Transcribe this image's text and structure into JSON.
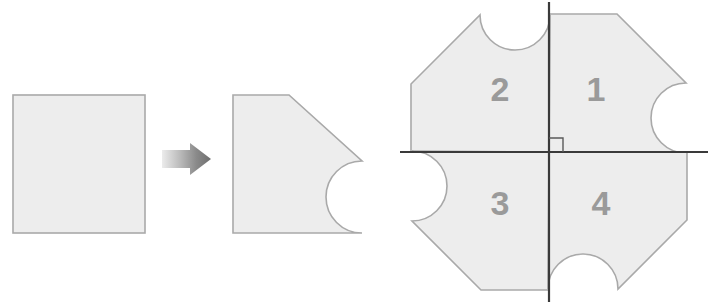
{
  "figure": {
    "background_color": "#ffffff",
    "shape_fill": "#ededed",
    "shape_stroke": "#a9a9a9",
    "axis_color": "#3a3a3a",
    "label_color": "#9a9a9a",
    "arrow_color_start": "#e8e8e8",
    "arrow_color_end": "#6e6e6e"
  },
  "panels": {
    "source_square": {
      "name": "square",
      "x": 13,
      "y": 95,
      "width": 132,
      "height": 138
    },
    "transform_arrow": {
      "name": "right-arrow",
      "x": 162,
      "y": 143,
      "width": 48,
      "height": 32,
      "direction": "right"
    },
    "result_shape": {
      "name": "notched-quarter-shape",
      "description": "square with top-right corner cut diagonally and a semicircular notch on the right edge"
    },
    "quadrant_figure": {
      "name": "four-quadrant-rotational-shape",
      "center_x": 549,
      "center_y": 152,
      "right_angle_marker": true,
      "quadrants": [
        {
          "label": "1",
          "position": "top-right",
          "label_x": 596,
          "label_y": 92
        },
        {
          "label": "2",
          "position": "top-left",
          "label_x": 500,
          "label_y": 92
        },
        {
          "label": "3",
          "position": "bottom-left",
          "label_x": 500,
          "label_y": 206
        },
        {
          "label": "4",
          "position": "bottom-right",
          "label_x": 601,
          "label_y": 206
        }
      ],
      "axes": {
        "horizontal": {
          "x1": 400,
          "y1": 152,
          "x2": 708,
          "y2": 152
        },
        "vertical": {
          "x1": 549,
          "y1": 2,
          "x2": 549,
          "y2": 302
        }
      }
    }
  }
}
